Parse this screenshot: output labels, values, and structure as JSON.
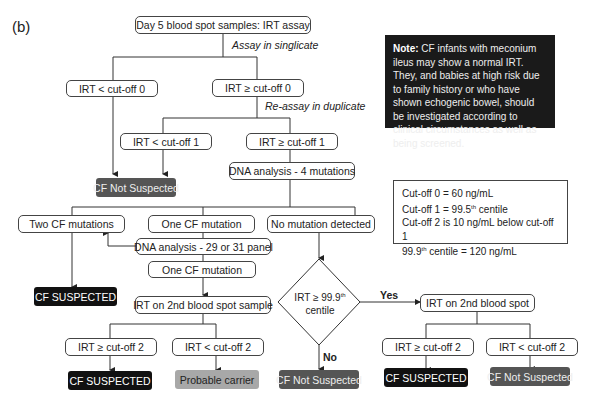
{
  "panel_label": "(b)",
  "nodes": {
    "start": "Day 5 blood spot samples: IRT assay",
    "assay_singlicate": "Assay in singlicate",
    "irt_lt_0": "IRT < cut-off 0",
    "irt_ge_0": "IRT ≥ cut-off 0",
    "reassay_duplicate": "Re-assay in duplicate",
    "irt_lt_1": "IRT < cut-off 1",
    "irt_ge_1": "IRT ≥ cut-off 1",
    "cf_not_suspected_1": "CF Not Suspected",
    "dna_4": "DNA analysis - 4 mutations",
    "two_cf": "Two CF mutations",
    "one_cf": "One CF mutation",
    "no_mutation": "No mutation detected",
    "dna_panel": "DNA analysis - 29 or 31 panel",
    "one_cf_2": "One CF mutation",
    "cf_suspected_1": "CF SUSPECTED",
    "irt_2nd_sample": "IRT on 2nd blood spot sample",
    "diamond_line1": "IRT ≥ 99.9",
    "diamond_sup": "th",
    "diamond_line2": "centile",
    "yes": "Yes",
    "no": "No",
    "irt_2nd_spot": "IRT on 2nd blood spot",
    "left_irt_ge_2": "IRT ≥ cut-off 2",
    "left_irt_lt_2": "IRT < cut-off 2",
    "cf_suspected_2": "CF SUSPECTED",
    "probable_carrier": "Probable carrier",
    "cf_not_suspected_2": "CF Not Suspected",
    "right_irt_ge_2": "IRT ≥ cut-off 2",
    "right_irt_lt_2": "IRT < cut-off 2",
    "cf_suspected_3": "CF SUSPECTED",
    "cf_not_suspected_3": "CF Not Suspected"
  },
  "note": {
    "bold": "Note:",
    "text": " CF infants with meconium ileus may show a normal IRT. They, and babies at high risk due to family history or who have shown echogenic bowel, should be investigated according to clinical circumstances as well as being screened."
  },
  "cutoffs": {
    "line1": "Cut-off 0 = 60 ng/mL",
    "line2_pre": "Cut-off 1 = 99.5",
    "line2_sup": "th",
    "line2_post": " centile",
    "line3": "Cut-off 2 is 10 ng/mL below cut-off 1",
    "line4_pre": "99.9",
    "line4_sup": "th",
    "line4_post": " centile = 120 ng/mL"
  },
  "colors": {
    "dark": "#111111",
    "grey": "#555555",
    "light_grey": "#a8a8a8",
    "line": "#333333"
  }
}
